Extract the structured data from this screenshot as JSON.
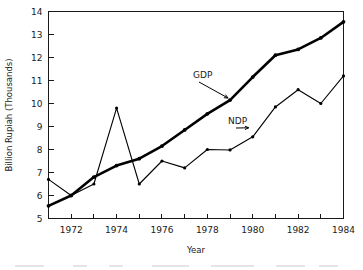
{
  "chart_data": {
    "type": "line",
    "title": "",
    "xlabel": "Year",
    "ylabel": "Billion Rupiah (Thousands)",
    "x": [
      1971,
      1972,
      1973,
      1974,
      1975,
      1976,
      1977,
      1978,
      1979,
      1980,
      1981,
      1982,
      1983,
      1984
    ],
    "xlim": [
      1971,
      1984
    ],
    "ylim": [
      5,
      14
    ],
    "xtick_values": [
      1971,
      1972,
      1973,
      1974,
      1975,
      1976,
      1977,
      1978,
      1979,
      1980,
      1981,
      1982,
      1983,
      1984
    ],
    "xtick_labels": [
      "",
      "1972",
      "",
      "1974",
      "",
      "1976",
      "",
      "1978",
      "",
      "1980",
      "",
      "1982",
      "",
      "1984"
    ],
    "ytick_values": [
      5,
      6,
      7,
      8,
      9,
      10,
      11,
      12,
      13,
      14
    ],
    "ytick_labels": [
      "5",
      "6",
      "7",
      "8",
      "9",
      "10",
      "11",
      "12",
      "13",
      "14"
    ],
    "grid": false,
    "legend_position": "inline-annotations",
    "series": [
      {
        "name": "GDP",
        "values": [
          5.55,
          6.0,
          6.8,
          7.3,
          7.6,
          8.15,
          8.85,
          9.55,
          10.15,
          11.15,
          12.1,
          12.35,
          12.85,
          13.55
        ],
        "style": "thick-line-with-markers"
      },
      {
        "name": "NDP",
        "values": [
          6.7,
          6.0,
          6.5,
          9.8,
          6.5,
          7.5,
          7.2,
          8.0,
          7.98,
          8.55,
          9.85,
          10.6,
          10.0,
          11.2
        ],
        "style": "thin-line-with-markers"
      }
    ],
    "annotations": [
      {
        "label": "GDP",
        "target_year": 1979,
        "target_value": 10.15
      },
      {
        "label": "NDP",
        "target_year": 1980,
        "target_value": 8.9
      }
    ]
  }
}
